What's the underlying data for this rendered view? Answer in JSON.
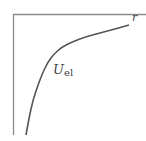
{
  "diagram": {
    "axis_color": "#8a8a8a",
    "curve_color": "#555555",
    "x_axis_label": "r",
    "curve_label_main": "U",
    "curve_label_sub": "el",
    "curve_points": [
      [
        26,
        135
      ],
      [
        29,
        118
      ],
      [
        33,
        100
      ],
      [
        38,
        85
      ],
      [
        43,
        72
      ],
      [
        48,
        62
      ],
      [
        54,
        54
      ],
      [
        62,
        47
      ],
      [
        72,
        42
      ],
      [
        85,
        37
      ],
      [
        100,
        33
      ],
      [
        115,
        29
      ],
      [
        129,
        25
      ]
    ]
  }
}
